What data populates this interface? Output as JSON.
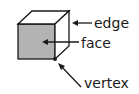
{
  "diagram": {
    "colors": {
      "face_fill": "#b3b3b3",
      "line": "#1a1a1a",
      "background": "#ffffff"
    },
    "labels": {
      "edge": "edge",
      "face": "face",
      "vertex": "vertex"
    }
  }
}
